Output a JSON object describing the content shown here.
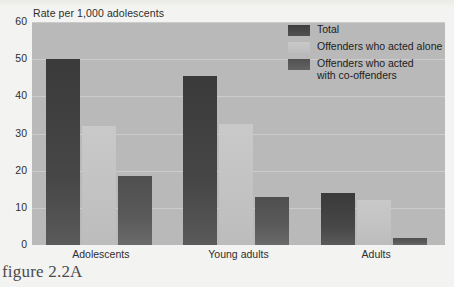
{
  "figure": {
    "caption": "figure 2.2A"
  },
  "chart_data": {
    "type": "bar",
    "title": "Rate per 1,000 adolescents",
    "xlabel": "",
    "ylabel": "Rate per 1,000 adolescents",
    "ylim": [
      0,
      60
    ],
    "yticks": [
      0,
      10,
      20,
      30,
      40,
      50,
      60
    ],
    "ytick_labels": [
      "0",
      "10",
      "20",
      "30",
      "40",
      "50",
      "60"
    ],
    "grid": true,
    "legend_position": "top-right",
    "categories": [
      "Adolescents",
      "Young adults",
      "Adults"
    ],
    "series": [
      {
        "name": "Total",
        "color": "#3d3d3d",
        "values": [
          50,
          45.5,
          14
        ]
      },
      {
        "name": "Offenders who acted alone",
        "color": "#c6c6c6",
        "values": [
          32,
          32.5,
          12
        ]
      },
      {
        "name": "Offenders who acted with co-offenders",
        "color": "#575757",
        "values": [
          18.5,
          13,
          2
        ]
      }
    ],
    "legend_entries": [
      "Total",
      "Offenders who acted alone",
      "Offenders who acted\nwith co-offenders"
    ]
  },
  "colors": {
    "plot_background": "#b9b9b9",
    "page_background": "#f3f3f1",
    "gridline": "#cfcfcf",
    "text": "#2e2e2e"
  }
}
